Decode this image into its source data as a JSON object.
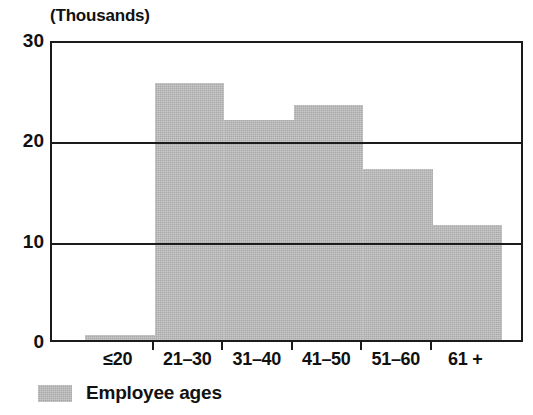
{
  "chart_data": {
    "type": "bar",
    "title": "(Thousands)",
    "xlabel": "",
    "ylabel": "(Thousands)",
    "categories": [
      "≤20",
      "21–30",
      "31–40",
      "41–50",
      "51–60",
      "61 +"
    ],
    "values": [
      0.5,
      25.6,
      21.9,
      23.4,
      17.0,
      11.5
    ],
    "series": [
      {
        "name": "Employee ages",
        "values": [
          0.5,
          25.6,
          21.9,
          23.4,
          17.0,
          11.5
        ],
        "color": "#a9a9a9"
      }
    ],
    "ylim": [
      0,
      30
    ],
    "y_ticks": [
      0,
      10,
      20,
      30
    ],
    "y_tick_labels": [
      "0",
      "10",
      "20",
      "30"
    ],
    "y_minor_tick_interval": 2,
    "gridlines": [
      10,
      20
    ],
    "grid": true,
    "legend": {
      "position": "below-left",
      "entries": [
        "Employee ages"
      ]
    },
    "bar_style": "histogram-contiguous"
  },
  "legend": {
    "label": "Employee ages",
    "swatch_color": "#a9a9a9"
  },
  "axes": {
    "y_title": "(Thousands)",
    "frame_color": "#1b1b1b"
  }
}
